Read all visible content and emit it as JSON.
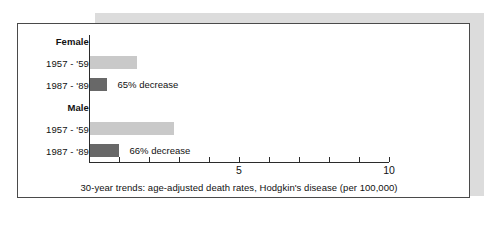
{
  "chart_data": {
    "type": "bar",
    "orientation": "horizontal",
    "title": "",
    "caption": "30-year trends: age-adjusted death rates, Hodgkin's disease (per 100,000)",
    "xlabel": "",
    "ylabel": "",
    "xlim": [
      0,
      10
    ],
    "grid": false,
    "legend": "none",
    "tick_values": [
      0,
      1,
      2,
      3,
      4,
      5,
      6,
      7,
      8,
      9,
      10
    ],
    "tick_labels_shown": [
      "5",
      "10"
    ],
    "groups": [
      {
        "name": "Female",
        "bars": [
          {
            "category": "1957 - '59",
            "value": 1.55,
            "style": "light",
            "note": ""
          },
          {
            "category": "1987 - '89",
            "value": 0.55,
            "style": "dark",
            "note": "65% decrease"
          }
        ]
      },
      {
        "name": "Male",
        "bars": [
          {
            "category": "1957 - '59",
            "value": 2.8,
            "style": "light",
            "note": ""
          },
          {
            "category": "1987 - '89",
            "value": 0.95,
            "style": "dark",
            "note": "66% decrease"
          }
        ]
      }
    ],
    "colors": {
      "light_bar": "#c9c9c9",
      "dark_bar": "#686868",
      "axis": "#2b2b2b",
      "frame": "#4a4a4a",
      "shadow": "#dcdcdc",
      "text": "#111111"
    }
  }
}
